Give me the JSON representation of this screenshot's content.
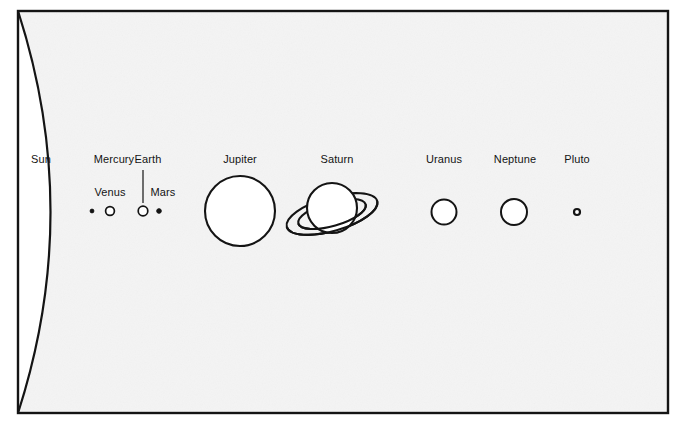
{
  "diagram": {
    "background_color": "#ffffff",
    "plate_color": "#f4f4f4",
    "ink_color": "#141414",
    "frame": {
      "x": 18,
      "y": 11,
      "width": 650,
      "height": 402,
      "stroke_width": 2.4
    },
    "sun_limb": {
      "description": "Large arc representing the Sun's limb, bulging rightward from the frame's left edge",
      "bulge_x": 83,
      "stroke_width": 2.2
    }
  },
  "bodies": [
    {
      "name": "Sun",
      "label": "Sun",
      "shape": "arc",
      "label_x": 41,
      "label_y": 163,
      "cx": 41,
      "cy": 211,
      "radius": 0
    },
    {
      "name": "Mercury",
      "label": "Mercury",
      "shape": "dot",
      "label_x": 114,
      "label_y": 163,
      "cx": 92,
      "cy": 211,
      "radius": 1.9,
      "filled": true
    },
    {
      "name": "Venus",
      "label": "Venus",
      "shape": "circle",
      "label_x": 110,
      "label_y": 196,
      "cx": 110,
      "cy": 211,
      "radius": 4.4,
      "filled": false
    },
    {
      "name": "Earth",
      "label": "Earth",
      "shape": "circle",
      "label_x": 148,
      "label_y": 163,
      "cx": 143,
      "cy": 211,
      "radius": 4.8,
      "filled": false,
      "leader_line": {
        "x": 143,
        "y1": 170,
        "y2": 203
      }
    },
    {
      "name": "Mars",
      "label": "Mars",
      "shape": "dot",
      "label_x": 163,
      "label_y": 196,
      "cx": 159,
      "cy": 211,
      "radius": 2.3,
      "filled": true
    },
    {
      "name": "Jupiter",
      "label": "Jupiter",
      "shape": "circle",
      "label_x": 240,
      "label_y": 163,
      "cx": 240,
      "cy": 211,
      "radius": 35,
      "filled": false
    },
    {
      "name": "Saturn",
      "label": "Saturn",
      "shape": "ringed-circle",
      "label_x": 337,
      "label_y": 163,
      "cx": 332,
      "cy": 208,
      "radius": 25,
      "filled": false,
      "ring": {
        "rx_outer": 47,
        "ry_outer": 17,
        "rx_inner": 35,
        "ry_inner": 12,
        "tilt_deg": -16,
        "cy": 214
      }
    },
    {
      "name": "Uranus",
      "label": "Uranus",
      "shape": "circle",
      "label_x": 444,
      "label_y": 163,
      "cx": 444,
      "cy": 212,
      "radius": 12.5,
      "filled": false
    },
    {
      "name": "Neptune",
      "label": "Neptune",
      "shape": "circle",
      "label_x": 515,
      "label_y": 163,
      "cx": 514,
      "cy": 212,
      "radius": 13,
      "filled": false
    },
    {
      "name": "Pluto",
      "label": "Pluto",
      "shape": "circle",
      "label_x": 577,
      "label_y": 163,
      "cx": 577,
      "cy": 212,
      "radius": 3,
      "filled": false
    }
  ]
}
